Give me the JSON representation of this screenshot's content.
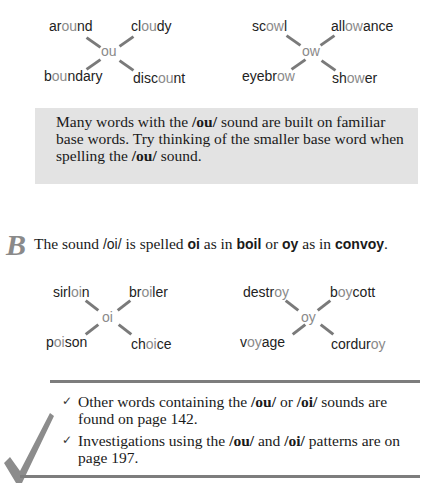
{
  "webs": [
    {
      "center": "ou",
      "words": [
        {
          "pre": "ar",
          "hl": "ou",
          "post": "nd"
        },
        {
          "pre": "cl",
          "hl": "ou",
          "post": "dy"
        },
        {
          "pre": "b",
          "hl": "ou",
          "post": "ndary"
        },
        {
          "pre": "disc",
          "hl": "ou",
          "post": "nt"
        }
      ]
    },
    {
      "center": "ow",
      "words": [
        {
          "pre": "sc",
          "hl": "ow",
          "post": "l"
        },
        {
          "pre": "all",
          "hl": "ow",
          "post": "ance"
        },
        {
          "pre": "eyebr",
          "hl": "ow",
          "post": ""
        },
        {
          "pre": "sh",
          "hl": "ow",
          "post": "er"
        }
      ]
    },
    {
      "center": "oi",
      "words": [
        {
          "pre": "sirl",
          "hl": "oi",
          "post": "n"
        },
        {
          "pre": "br",
          "hl": "oi",
          "post": "ler"
        },
        {
          "pre": "p",
          "hl": "oi",
          "post": "son"
        },
        {
          "pre": "ch",
          "hl": "oi",
          "post": "ce"
        }
      ]
    },
    {
      "center": "oy",
      "words": [
        {
          "pre": "destr",
          "hl": "oy",
          "post": ""
        },
        {
          "pre": "b",
          "hl": "oy",
          "post": "cott"
        },
        {
          "pre": "v",
          "hl": "oy",
          "post": "age"
        },
        {
          "pre": "cordur",
          "hl": "oy",
          "post": ""
        }
      ]
    }
  ],
  "tip": {
    "part1": "Many words with the ",
    "bold1": "/ou/",
    "part2": " sound are built on familiar base words. Try thinking of the smaller base word when spelling the ",
    "bold2": "/ou/",
    "part3": " sound."
  },
  "section_b": {
    "letter": "B",
    "t1": "The sound ",
    "s1": "/oi/",
    "t2": " is spelled ",
    "b1": "oi",
    "t3": " as in ",
    "b2": "boil",
    "t4": " or ",
    "b3": "oy",
    "t5": " as in ",
    "b4": "convoy",
    "t6": "."
  },
  "notes": [
    {
      "t1": "Other words containing the ",
      "b1": "/ou/",
      "t2": " or ",
      "b2": "/oi/",
      "t3": " sounds are found on page 142."
    },
    {
      "t1": "Investigations using the ",
      "b1": "/ou/",
      "t2": " and ",
      "b2": "/oi/",
      "t3": " patterns are on page 197."
    }
  ],
  "icons": {
    "check_small": "✓",
    "check_large": "checkmark"
  }
}
